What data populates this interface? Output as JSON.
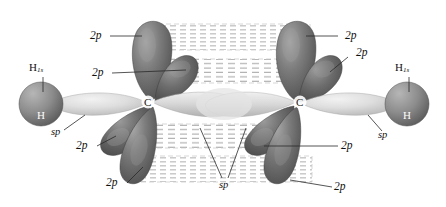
{
  "figure": {
    "kind": "orbital-diagram",
    "molecule": "acetylene"
  },
  "atoms": {
    "hydrogen_left": "H",
    "hydrogen_right": "H",
    "carbon_left": "C",
    "carbon_right": "C"
  },
  "labels": {
    "h1s_left": "H",
    "h1s_left_sub": "1s",
    "h1s_right": "H",
    "h1s_right_sub": "1s",
    "sp_left": "sp",
    "sp_right": "sp",
    "sp_bottom": "sp",
    "p_top_left_outer": "2p",
    "p_top_left_inner": "2p",
    "p_top_right_outer": "2p",
    "p_top_right_inner": "2p",
    "p_bottom_left_inner": "2p",
    "p_bottom_left_outer": "2p",
    "p_bottom_right_inner": "2p",
    "p_bottom_right_outer": "2p"
  },
  "colors": {
    "p_orbital_dark": "#6e6e6e",
    "p_orbital_darker": "#575757",
    "sp_orbital_light": "#cfcfcf",
    "atom_sphere": "#8f8f8f",
    "pi_overlap_dash": "#b9b9b9",
    "leader_line": "#2a2a2a",
    "background": "#ffffff"
  }
}
